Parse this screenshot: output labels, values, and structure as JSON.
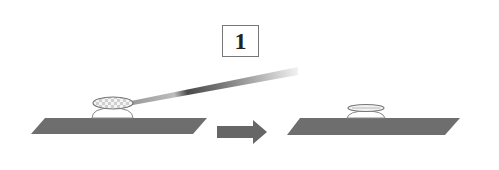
{
  "diagram": {
    "step_label": "1",
    "colors": {
      "substrate": "#6e6e6e",
      "arrow": "#666666",
      "needle_dark": "#4a4a4a",
      "needle_light": "#f2f2f2",
      "dome_fill": "#ffffff",
      "outline": "#777777",
      "box_border": "#777777"
    },
    "panels": [
      {
        "name": "before",
        "substrate": {
          "top_left": [
            45,
            118
          ],
          "top_right": [
            207,
            118
          ],
          "bottom_right": [
            193,
            134
          ],
          "bottom_left": [
            31,
            134
          ]
        },
        "dome": {
          "x1": 92,
          "x2": 133,
          "base_y": 118,
          "top_y": 108
        },
        "droplet": {
          "cx": 113,
          "cy": 103,
          "rx": 20,
          "ry": 6
        },
        "needle": {
          "tip": [
            133,
            103
          ],
          "end_top": [
            298,
            67
          ],
          "end_bottom": [
            298,
            75
          ]
        }
      },
      {
        "name": "after",
        "substrate": {
          "top_left": [
            300,
            118
          ],
          "top_right": [
            460,
            118
          ],
          "bottom_right": [
            445,
            135
          ],
          "bottom_left": [
            287,
            135
          ]
        },
        "dome": {
          "x1": 347,
          "x2": 385,
          "base_y": 118,
          "top_y": 111
        },
        "lens": {
          "cx": 366,
          "cy": 108,
          "rx": 18,
          "ry": 3.5
        }
      }
    ],
    "arrow": {
      "shaft_x1": 217,
      "shaft_x2": 253,
      "shaft_y1": 126,
      "shaft_y2": 138,
      "head_x": 267,
      "head_y1": 120,
      "head_y2": 144
    }
  }
}
